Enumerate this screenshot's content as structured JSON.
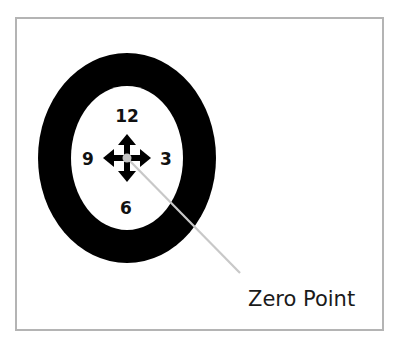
{
  "diagram": {
    "clock_labels": {
      "top": "12",
      "right": "3",
      "bottom": "6",
      "left": "9"
    },
    "center_icon": "move-arrows-icon",
    "callout": {
      "label": "Zero Point",
      "line_color": "#c8c8c8"
    },
    "colors": {
      "ring": "#000000",
      "inner": "#ffffff",
      "zero_dot": "#c4c4c4",
      "frame_border": "#b4b4b4"
    }
  }
}
